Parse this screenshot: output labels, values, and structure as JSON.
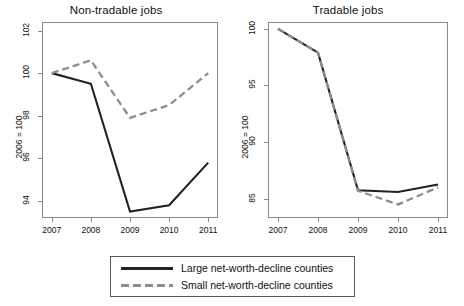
{
  "figure": {
    "background": "#ffffff",
    "axis_title": "2006 = 100",
    "colors": {
      "large_series": "#222222",
      "small_series": "#8d8d8d",
      "frame": "#8a8a8a",
      "text": "#111111"
    }
  },
  "legend": {
    "entries": [
      {
        "label": "Large net-worth-decline counties",
        "style": "solid",
        "color": "#222222"
      },
      {
        "label": "Small net-worth-decline counties",
        "style": "dashed",
        "color": "#8d8d8d"
      }
    ]
  },
  "chart_data": [
    {
      "type": "line",
      "title": "Non-tradable jobs",
      "xlabel": "",
      "ylabel": "2006 = 100",
      "x": [
        2007,
        2008,
        2009,
        2010,
        2011
      ],
      "xticklabels": [
        "2007",
        "2008",
        "2009",
        "2010",
        "2011"
      ],
      "xlim": [
        2006.75,
        2011.25
      ],
      "ylim": [
        93.2,
        102.4
      ],
      "yticks": [
        94,
        96,
        98,
        100,
        102
      ],
      "yticklabels": [
        "94",
        "96",
        "98",
        "100",
        "102"
      ],
      "grid": false,
      "legend_position": "below-figure",
      "series": [
        {
          "name": "Large net-worth-decline counties",
          "style": "solid",
          "color": "#222222",
          "values": [
            100.0,
            99.5,
            93.5,
            93.8,
            95.8
          ]
        },
        {
          "name": "Small net-worth-decline counties",
          "style": "dashed",
          "color": "#8d8d8d",
          "values": [
            100.0,
            100.6,
            97.9,
            98.5,
            100.0
          ]
        }
      ]
    },
    {
      "type": "line",
      "title": "Tradable jobs",
      "xlabel": "",
      "ylabel": "2006 = 100",
      "x": [
        2007,
        2008,
        2009,
        2010,
        2011
      ],
      "xticklabels": [
        "2007",
        "2008",
        "2009",
        "2010",
        "2011"
      ],
      "xlim": [
        2006.75,
        2011.25
      ],
      "ylim": [
        83.3,
        100.6
      ],
      "yticks": [
        85,
        90,
        95,
        100
      ],
      "yticklabels": [
        "85",
        "90",
        "95",
        "100"
      ],
      "grid": false,
      "legend_position": "below-figure",
      "series": [
        {
          "name": "Large net-worth-decline counties",
          "style": "solid",
          "color": "#222222",
          "values": [
            100.0,
            97.9,
            85.75,
            85.6,
            86.25
          ]
        },
        {
          "name": "Small net-worth-decline counties",
          "style": "dashed",
          "color": "#8d8d8d",
          "values": [
            100.0,
            97.9,
            85.7,
            84.5,
            86.0
          ]
        }
      ]
    }
  ]
}
